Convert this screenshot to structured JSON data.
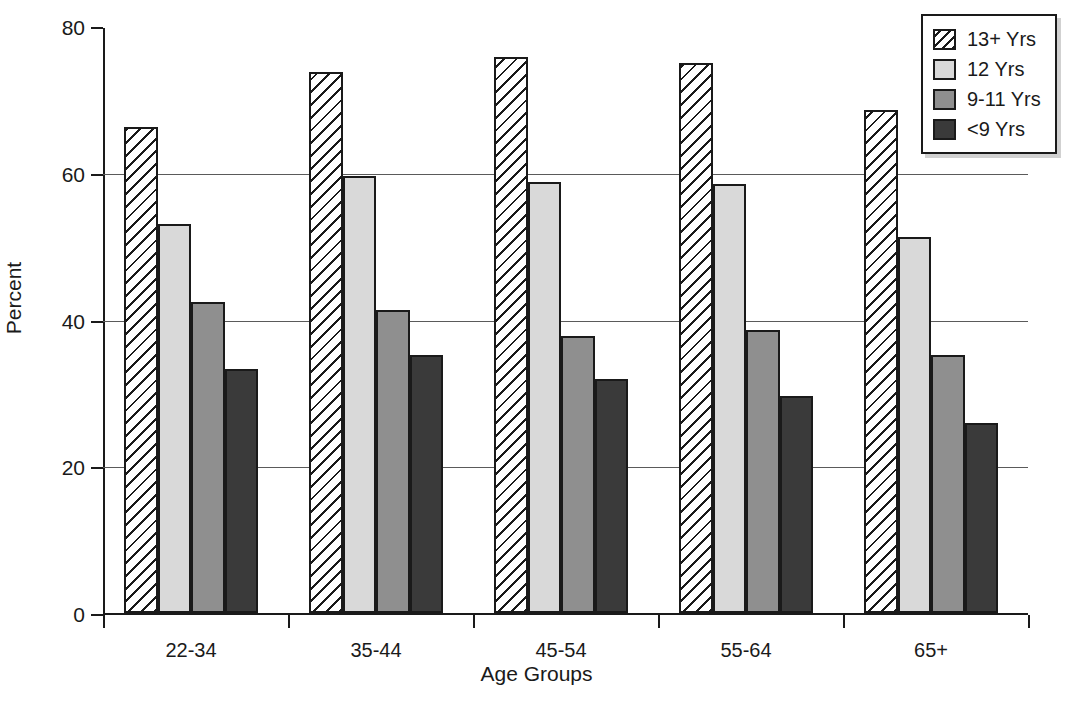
{
  "chart_data": {
    "type": "bar",
    "title": "",
    "xlabel": "Age Groups",
    "ylabel": "Percent",
    "categories": [
      "22-34",
      "35-44",
      "45-54",
      "55-64",
      "65+"
    ],
    "series": [
      {
        "name": "13+ Yrs",
        "color": "#ffffff",
        "pattern": "diagonal-hatch",
        "values": [
          66.2,
          73.8,
          75.8,
          75.0,
          68.6
        ]
      },
      {
        "name": "12 Yrs",
        "color": "#d9d9d9",
        "pattern": "solid",
        "values": [
          53.0,
          59.5,
          58.7,
          58.5,
          51.2
        ]
      },
      {
        "name": "9-11 Yrs",
        "color": "#8f8f8f",
        "pattern": "solid",
        "values": [
          42.4,
          41.3,
          37.7,
          38.6,
          35.2
        ]
      },
      {
        "name": "<9 Yrs",
        "color": "#3a3a3a",
        "pattern": "solid",
        "values": [
          33.2,
          35.2,
          31.9,
          29.6,
          25.9
        ]
      }
    ],
    "ylim": [
      0,
      80
    ],
    "yticks": [
      0,
      20,
      40,
      60,
      80
    ],
    "ytick_labels": [
      "0",
      "20",
      "40",
      "60",
      "80"
    ],
    "grid": "horizontal",
    "legend_position": "top-right"
  },
  "legend": {
    "items": [
      {
        "label": "13+ Yrs"
      },
      {
        "label": "12 Yrs"
      },
      {
        "label": "9-11 Yrs"
      },
      {
        "label": "<9 Yrs"
      }
    ]
  }
}
